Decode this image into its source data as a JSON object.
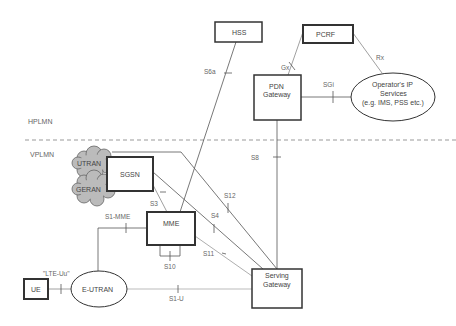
{
  "regions": {
    "home": "HPLMN",
    "visited": "VPLMN"
  },
  "nodes": {
    "hss": "HSS",
    "pcrf": "PCRF",
    "pdn_gw_line1": "PDN",
    "pdn_gw_line2": "Gateway",
    "ip_services_line1": "Operator's IP",
    "ip_services_line2": "Services",
    "ip_services_line3": "(e.g. IMS, PSS etc.)",
    "utran": "UTRAN",
    "geran": "GERAN",
    "sgsn": "SGSN",
    "mme": "MME",
    "serving_gw_line1": "Serving",
    "serving_gw_line2": "Gateway",
    "ue": "UE",
    "eutran": "E-UTRAN"
  },
  "interfaces": {
    "s6a": "S6a",
    "gx": "Gx",
    "rx": "Rx",
    "sgi": "SGi",
    "s8": "S8",
    "s12": "S12",
    "s4": "S4",
    "s3": "S3",
    "s1_mme": "S1-MME",
    "s11": "S11",
    "s10": "S10",
    "s1_u": "S1-U",
    "lte_uu": "\"LTE-Uu\""
  }
}
